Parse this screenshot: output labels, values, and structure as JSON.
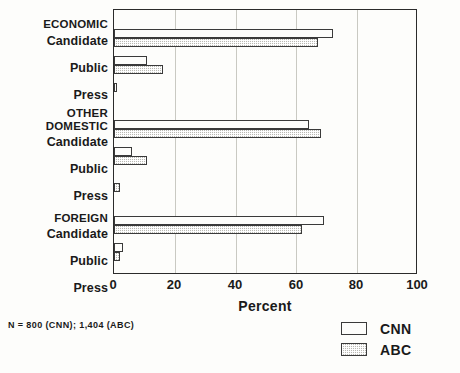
{
  "chart_data": {
    "type": "bar",
    "orientation": "horizontal",
    "title": "",
    "xlabel": "Percent",
    "ylabel": "",
    "xlim": [
      0,
      100
    ],
    "xticks": [
      0,
      20,
      40,
      60,
      80,
      100
    ],
    "grid": true,
    "legend_position": "bottom-right",
    "groups": [
      {
        "name": "ECONOMIC",
        "categories": [
          "Candidate",
          "Public",
          "Press"
        ],
        "values": {
          "CNN": [
            72,
            11,
            1
          ],
          "ABC": [
            67,
            16,
            0
          ]
        }
      },
      {
        "name": "OTHER DOMESTIC",
        "categories": [
          "Candidate",
          "Public",
          "Press"
        ],
        "values": {
          "CNN": [
            64,
            6,
            0
          ],
          "ABC": [
            68,
            11,
            2
          ]
        }
      },
      {
        "name": "FOREIGN",
        "categories": [
          "Candidate",
          "Public",
          "Press"
        ],
        "values": {
          "CNN": [
            69,
            3,
            0
          ],
          "ABC": [
            62,
            2,
            0
          ]
        }
      }
    ],
    "series": [
      {
        "name": "CNN",
        "values": [
          72,
          11,
          1,
          64,
          6,
          0,
          69,
          3,
          0
        ]
      },
      {
        "name": "ABC",
        "values": [
          67,
          16,
          0,
          68,
          11,
          2,
          62,
          2,
          0
        ]
      }
    ],
    "categories": [
      "ECONOMIC Candidate",
      "ECONOMIC Public",
      "ECONOMIC Press",
      "OTHER DOMESTIC Candidate",
      "OTHER DOMESTIC Public",
      "OTHER DOMESTIC Press",
      "FOREIGN Candidate",
      "FOREIGN Public",
      "FOREIGN Press"
    ],
    "annotations": [
      "N = 800 (CNN); 1,404 (ABC)"
    ]
  },
  "axis": {
    "x_title": "Percent",
    "x_ticks": [
      "0",
      "20",
      "40",
      "60",
      "80",
      "100"
    ],
    "group_titles": [
      "ECONOMIC",
      "OTHER",
      "DOMESTIC",
      "FOREIGN"
    ],
    "row_labels": [
      "Candidate",
      "Public",
      "Press",
      "Candidate",
      "Public",
      "Press",
      "Candidate",
      "Public",
      "Press"
    ]
  },
  "legend": {
    "items": [
      {
        "label": "CNN",
        "swatch": "white-outline"
      },
      {
        "label": "ABC",
        "swatch": "gray-hatched"
      }
    ]
  },
  "footnote": {
    "text": "N = 800 (CNN); 1,404 (ABC)"
  },
  "colors": {
    "cnn_fill": "#fdfdfb",
    "abc_fill": "#b9b9b2",
    "outline": "#3a3a3a",
    "grid": "#c9c9c2",
    "background": "#fdfdfb"
  }
}
